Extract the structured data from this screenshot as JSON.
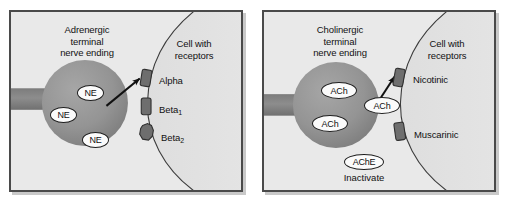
{
  "figure": {
    "background_color": "#ffffff",
    "panel_background": "#e9e9e9",
    "panel_border_color": "#4a4a4a",
    "terminal_fill": "#8f8f8f",
    "receptor_fill": "#6e6e6e",
    "arrow_color": "#111111",
    "text_color": "#111111"
  },
  "panels": [
    {
      "id": "adrenergic",
      "terminal_label": "Adrenergic\nterminal\nnerve ending",
      "cell_label": "Cell with\nreceptors",
      "neurotransmitter": "NE",
      "vesicles": [
        {
          "label": "NE"
        },
        {
          "label": "NE"
        },
        {
          "label": "NE"
        }
      ],
      "receptors": [
        {
          "label": "Alpha",
          "sub": ""
        },
        {
          "label": "Beta",
          "sub": "1"
        },
        {
          "label": "Beta",
          "sub": "2"
        }
      ],
      "enzyme": null,
      "enzyme_action": null
    },
    {
      "id": "cholinergic",
      "terminal_label": "Cholinergic\nterminal\nnerve ending",
      "cell_label": "Cell with\nreceptors",
      "neurotransmitter": "ACh",
      "vesicles": [
        {
          "label": "ACh"
        },
        {
          "label": "ACh"
        },
        {
          "label": "ACh"
        }
      ],
      "receptors": [
        {
          "label": "Nicotinic",
          "sub": ""
        },
        {
          "label": "Muscarinic",
          "sub": ""
        }
      ],
      "enzyme": "AChE",
      "enzyme_action": "Inactivate"
    }
  ]
}
